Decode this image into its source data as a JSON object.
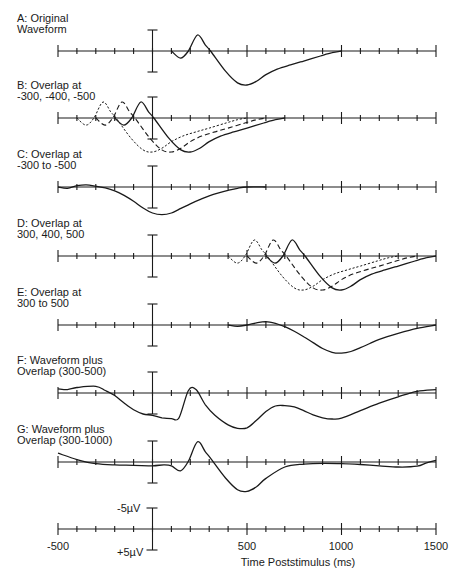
{
  "chart_data": {
    "type": "line",
    "title": "",
    "xlabel": "Time Poststimulus (ms)",
    "ylabel": "",
    "xlim": [
      -500,
      1500
    ],
    "x_ticks": [
      -500,
      500,
      1000,
      1500
    ],
    "x_minor_step": 100,
    "y_scale": {
      "top_label": "-5µV",
      "bottom_label": "+5µV",
      "note": "negative plotted up"
    },
    "grid": false,
    "base_waveform": {
      "t": [
        100,
        148,
        190,
        238,
        280,
        307,
        386,
        450,
        500,
        550,
        598,
        660,
        730,
        800,
        889,
        950,
        1000
      ],
      "uv": [
        0,
        1.7,
        0,
        -3.8,
        -1.4,
        0,
        4.8,
        7.6,
        8.1,
        7.2,
        5.7,
        4.3,
        3.3,
        2.4,
        1.2,
        0.4,
        0
      ]
    },
    "panels": [
      {
        "id": "A",
        "label_lines": [
          "A: Original",
          "Waveform"
        ],
        "series": [
          {
            "name": "original",
            "style": "solid",
            "shift_ms": 0
          }
        ]
      },
      {
        "id": "B",
        "label_lines": [
          "B: Overlap at",
          "-300, -400, -500"
        ],
        "series": [
          {
            "name": "shift -300",
            "style": "solid",
            "shift_ms": -300
          },
          {
            "name": "shift -400",
            "style": "dashed",
            "shift_ms": -400
          },
          {
            "name": "shift -500",
            "style": "dotted",
            "shift_ms": -500
          }
        ]
      },
      {
        "id": "C",
        "label_lines": [
          "C: Overlap at",
          "-300 to -500"
        ],
        "series": [
          {
            "name": "average overlap -300 to -500",
            "style": "solid",
            "t": [
              -500,
              -450,
              -400,
              -350,
              -300,
              -250,
              -200,
              -150,
              -100,
              -50,
              0,
              50,
              100,
              150,
              200,
              250,
              300,
              350,
              400,
              450,
              500,
              600
            ],
            "uv": [
              0,
              0.3,
              -0.3,
              -0.5,
              -0.2,
              0.2,
              0.9,
              2.0,
              3.4,
              5.0,
              6.2,
              6.6,
              6.2,
              5.1,
              4.0,
              3.0,
              2.1,
              1.4,
              0.8,
              0.3,
              0,
              0
            ]
          }
        ]
      },
      {
        "id": "D",
        "label_lines": [
          "D: Overlap at",
          "300, 400, 500"
        ],
        "series": [
          {
            "name": "shift 500",
            "style": "solid",
            "shift_ms": 500
          },
          {
            "name": "shift 400",
            "style": "dashed",
            "shift_ms": 400
          },
          {
            "name": "shift 300",
            "style": "dotted",
            "shift_ms": 300
          }
        ]
      },
      {
        "id": "E",
        "label_lines": [
          "E: Overlap at",
          "300 to 500"
        ],
        "series": [
          {
            "name": "average overlap 300 to 500",
            "style": "solid",
            "t": [
              400,
              450,
              500,
              550,
              600,
              650,
              700,
              750,
              800,
              850,
              900,
              950,
              1000,
              1050,
              1100,
              1150,
              1200,
              1300,
              1400,
              1500
            ],
            "uv": [
              0,
              0.3,
              0,
              -0.5,
              -0.8,
              -0.4,
              0.4,
              1.5,
              2.8,
              4.2,
              5.6,
              6.5,
              6.7,
              6.3,
              5.4,
              4.4,
              3.4,
              2.0,
              0.8,
              0
            ]
          }
        ]
      },
      {
        "id": "F",
        "label_lines": [
          "F: Waveform plus",
          "Overlap (300-500)"
        ],
        "series": [
          {
            "name": "waveform + overlap 300-500",
            "style": "solid",
            "t": [
              -500,
              -450,
              -400,
              -300,
              -250,
              -200,
              -150,
              -100,
              -50,
              0,
              50,
              100,
              140,
              190,
              230,
              280,
              330,
              400,
              450,
              500,
              550,
              600,
              650,
              700,
              750,
              800,
              850,
              900,
              950,
              1000,
              1100,
              1200,
              1300,
              1400,
              1500
            ],
            "uv": [
              -1,
              -0.8,
              -1.3,
              -1.6,
              -0.6,
              0.6,
              2.4,
              4.0,
              5.0,
              5.3,
              5.9,
              6.1,
              5.9,
              -0.6,
              -0.8,
              2.8,
              5.3,
              7.6,
              8.4,
              8.3,
              6.5,
              4.4,
              3.1,
              3.0,
              3.3,
              4.2,
              5.2,
              5.9,
              6.2,
              6.0,
              4.2,
              2.4,
              0.9,
              -0.4,
              -0.8
            ]
          }
        ]
      },
      {
        "id": "G",
        "label_lines": [
          "G: Waveform plus",
          "Overlap (300-1000)"
        ],
        "series": [
          {
            "name": "waveform + overlap 300-1000",
            "style": "solid",
            "t": [
              -500,
              -400,
              -300,
              -200,
              -100,
              0,
              60,
              100,
              148,
              190,
              238,
              280,
              307,
              386,
              450,
              500,
              550,
              600,
              700,
              800,
              900,
              1000,
              1100,
              1200,
              1300,
              1400,
              1450,
              1500
            ],
            "uv": [
              -2.1,
              -0.6,
              0.4,
              0.7,
              0.8,
              0.9,
              0.7,
              0.9,
              2.1,
              -0.2,
              -4.8,
              -2.4,
              -0.9,
              3.8,
              6.6,
              7.0,
              5.9,
              3.9,
              1.2,
              0.5,
              0.3,
              0.4,
              0.6,
              0.9,
              1.2,
              1.0,
              0.2,
              -0.4
            ]
          }
        ]
      },
      {
        "id": "scale",
        "label_lines": [],
        "series": []
      }
    ]
  },
  "axis_labels": {
    "tick_neg500": "-500",
    "tick_500": "500",
    "tick_1000": "1000",
    "tick_1500": "1500",
    "x_title": "Time Poststimulus (ms)",
    "scale_top": "-5µV",
    "scale_bottom": "+5µV"
  },
  "layout": {
    "x0_px": 58,
    "x1_px": 436,
    "t0": -500,
    "t1": 1500,
    "uv_px": 4.2,
    "bar_half_px": 21,
    "baselines": [
      51,
      118,
      187,
      256,
      325,
      393,
      462,
      529
    ],
    "labels_y": [
      22,
      89,
      158,
      227,
      296,
      364,
      433
    ]
  }
}
